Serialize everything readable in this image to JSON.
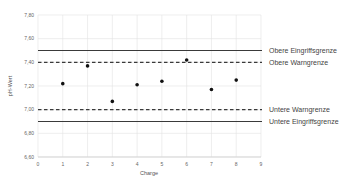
{
  "chart_data": {
    "type": "scatter",
    "title": "",
    "xlabel": "Charge",
    "ylabel": "pH-Wert",
    "xlim": [
      0,
      9
    ],
    "ylim": [
      6.6,
      7.8
    ],
    "x_ticks": [
      "0",
      "1",
      "2",
      "3",
      "4",
      "5",
      "6",
      "7",
      "8",
      "9"
    ],
    "y_ticks": [
      "6,60",
      "6,80",
      "7,00",
      "7,20",
      "7,40",
      "7,60",
      "7,80"
    ],
    "grid": true,
    "legend_position": "right",
    "series": [
      {
        "name": "pH-Wert",
        "style": "marker",
        "x": [
          1,
          2,
          3,
          4,
          5,
          6,
          7,
          8
        ],
        "values": [
          7.22,
          7.37,
          7.07,
          7.21,
          7.24,
          7.42,
          7.17,
          7.25
        ]
      }
    ],
    "reference_lines": [
      {
        "name": "Obere Eingriffsgrenze",
        "value": 7.5,
        "style": "solid"
      },
      {
        "name": "Obere Warngrenze",
        "value": 7.4,
        "style": "dashed"
      },
      {
        "name": "Untere Warngrenze",
        "value": 7.0,
        "style": "dashed"
      },
      {
        "name": "Untere Eingriffsgrenze",
        "value": 6.9,
        "style": "solid"
      }
    ],
    "colors": {
      "grid": "#e3e3e3",
      "line": "#3a3a3a",
      "marker": "#111111",
      "text": "#555555"
    }
  }
}
